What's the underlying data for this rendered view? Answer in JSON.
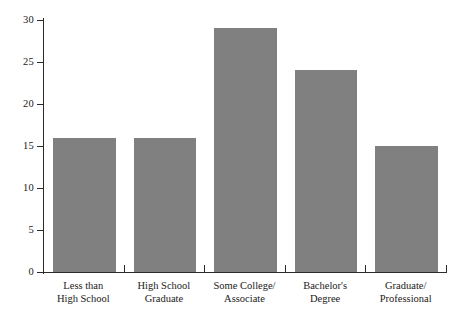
{
  "chart_data": {
    "type": "bar",
    "title": "",
    "subtitle": "",
    "xlabel": "",
    "ylabel": "",
    "categories": [
      "Less than High School",
      "High School Graduate",
      "Some College/Associate",
      "Bachelor's Degree",
      "Graduate/Professional"
    ],
    "category_lines": [
      [
        "Less than",
        "High School"
      ],
      [
        "High School",
        "Graduate"
      ],
      [
        "Some College/",
        "Associate"
      ],
      [
        "Bachelor's",
        "Degree"
      ],
      [
        "Graduate/",
        "Professional"
      ]
    ],
    "values": [
      16,
      16,
      29,
      24,
      15
    ],
    "ylim": [
      0,
      30
    ],
    "yticks": [
      0,
      5,
      10,
      15,
      20,
      25,
      30
    ],
    "ytick_labels": [
      "0",
      "5",
      "10",
      "15",
      "20",
      "25",
      "30"
    ],
    "grid": false,
    "legend": null,
    "legend_position": "none",
    "bar_color": "#808080",
    "axis_color": "#2b2b2b",
    "background_color": "#ffffff"
  }
}
